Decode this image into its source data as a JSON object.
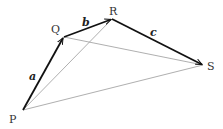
{
  "diagram": {
    "points": {
      "P": {
        "label": "P",
        "x": 23,
        "y": 110
      },
      "Q": {
        "label": "Q",
        "x": 64,
        "y": 37
      },
      "R": {
        "label": "R",
        "x": 112,
        "y": 19
      },
      "S": {
        "label": "S",
        "x": 203,
        "y": 65
      }
    },
    "vectors": [
      {
        "from": "P",
        "to": "Q",
        "label": "a"
      },
      {
        "from": "Q",
        "to": "R",
        "label": "b"
      },
      {
        "from": "R",
        "to": "S",
        "label": "c"
      }
    ],
    "thin_lines": [
      {
        "from": "P",
        "to": "R"
      },
      {
        "from": "Q",
        "to": "S"
      },
      {
        "from": "P",
        "to": "S"
      }
    ],
    "colors": {
      "vector": "#111111",
      "thin_line": "#999999"
    }
  }
}
